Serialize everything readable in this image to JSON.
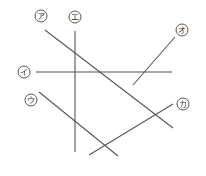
{
  "diagram": {
    "line_color": "#555555",
    "segments": [
      {
        "id": "a",
        "label": "ア",
        "label_pos": [
          41,
          16
        ],
        "x1": 45,
        "y1": 30,
        "x2": 173,
        "y2": 128
      },
      {
        "id": "i",
        "label": "イ",
        "label_pos": [
          24,
          72
        ],
        "x1": 36,
        "y1": 72,
        "x2": 172,
        "y2": 72
      },
      {
        "id": "u",
        "label": "ウ",
        "label_pos": [
          31,
          100
        ],
        "x1": 39,
        "y1": 92,
        "x2": 118,
        "y2": 156
      },
      {
        "id": "e",
        "label": "エ",
        "label_pos": [
          75,
          17
        ],
        "x1": 75,
        "y1": 31,
        "x2": 75,
        "y2": 152
      },
      {
        "id": "o",
        "label": "オ",
        "label_pos": [
          182,
          30
        ],
        "x1": 175,
        "y1": 37,
        "x2": 133,
        "y2": 85
      },
      {
        "id": "ka",
        "label": "カ",
        "label_pos": [
          183,
          104
        ],
        "x1": 173,
        "y1": 104,
        "x2": 89,
        "y2": 155
      }
    ]
  }
}
